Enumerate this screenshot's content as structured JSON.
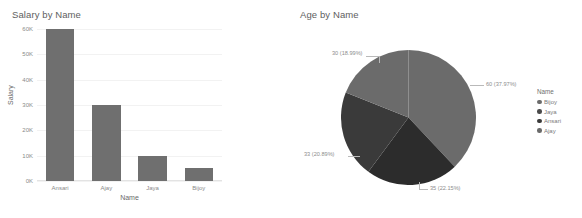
{
  "chart_data": [
    {
      "type": "bar",
      "title": "Salary by Name",
      "xlabel": "Name",
      "ylabel": "Salary",
      "categories": [
        "Ansari",
        "Ajay",
        "Jaya",
        "Bijoy"
      ],
      "values": [
        60000,
        30000,
        10000,
        5000
      ],
      "ylim": [
        0,
        60000
      ],
      "yticks": [
        0,
        10000,
        20000,
        30000,
        40000,
        50000,
        60000
      ],
      "ytick_labels": [
        "0K",
        "10K",
        "20K",
        "30K",
        "40K",
        "50K",
        "60K"
      ],
      "grid": true,
      "legend": false,
      "bar_color": "#6f6f6f"
    },
    {
      "type": "pie",
      "title": "Age by Name",
      "legend_title": "Name",
      "legend_position": "right",
      "categories": [
        "Bijoy",
        "Jaya",
        "Ansari",
        "Ajay"
      ],
      "values": [
        60,
        35,
        33,
        30
      ],
      "percentages": [
        37.97,
        22.15,
        20.89,
        18.99
      ],
      "labels": [
        "60 (37.97%)",
        "35 (22.15%)",
        "33 (20.89%)",
        "30 (18.99%)"
      ],
      "colors": [
        "#6b6b6b",
        "#2c2c2c",
        "#3a3a3a",
        "#6b6b6b"
      ]
    }
  ],
  "bar_chart": {
    "title": "Salary by Name",
    "x_axis_label": "Name",
    "y_axis_label": "Salary",
    "y_ticks": [
      {
        "label": "60K"
      },
      {
        "label": "50K"
      },
      {
        "label": "40K"
      },
      {
        "label": "30K"
      },
      {
        "label": "20K"
      },
      {
        "label": "10K"
      },
      {
        "label": "0K"
      }
    ],
    "bars": [
      {
        "label": "Ansari",
        "value": 60000
      },
      {
        "label": "Ajay",
        "value": 30000
      },
      {
        "label": "Jaya",
        "value": 10000
      },
      {
        "label": "Bijoy",
        "value": 5000
      }
    ]
  },
  "pie_chart": {
    "title": "Age by Name",
    "slices": [
      {
        "label": "60 (37.97%)",
        "name": "Bijoy",
        "value": 60,
        "percent": "37.97%",
        "color": "#6b6b6b"
      },
      {
        "label": "35 (22.15%)",
        "name": "Jaya",
        "value": 35,
        "percent": "22.15%",
        "color": "#2c2c2c"
      },
      {
        "label": "33 (20.89%)",
        "name": "Ansari",
        "value": 33,
        "percent": "20.89%",
        "color": "#3a3a3a"
      },
      {
        "label": "30 (18.99%)",
        "name": "Ajay",
        "value": 30,
        "percent": "18.99%",
        "color": "#6b6b6b"
      }
    ],
    "legend": {
      "title": "Name",
      "items": [
        {
          "label": "Bijoy",
          "color": "#6b6b6b"
        },
        {
          "label": "Jaya",
          "color": "#4a4a4a"
        },
        {
          "label": "Ansari",
          "color": "#3a3a3a"
        },
        {
          "label": "Ajay",
          "color": "#6b6b6b"
        }
      ]
    }
  }
}
